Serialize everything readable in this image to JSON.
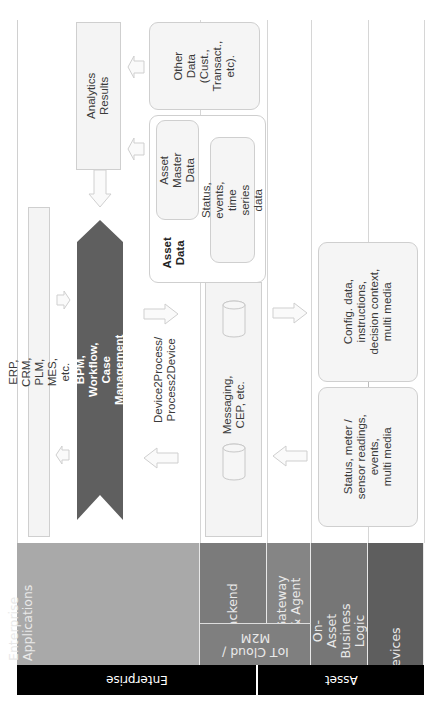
{
  "diagram": {
    "orientation": "rotated 90deg counter-clockwise (text reads bottom-to-top)",
    "layers": {
      "enterprise_applications": "Enterprise\nApplications",
      "iot_cloud_m2m": "IoT Cloud /\nM2M",
      "backend": "Backend",
      "gateway_agent": "Gateway\n& Agent",
      "on_asset_business_logic": "On-Asset\nBusiness Logic",
      "devices": "Devices"
    },
    "groups": {
      "enterprise": "Enterprise",
      "asset": "Asset"
    },
    "nodes": {
      "analytics_results": "Analytics\nResults",
      "other_data": "Other\nData\n(Cust.,\nTransact.,\netc).",
      "asset_data_title": "Asset\nData",
      "asset_master_data": "Asset\nMaster Data",
      "status_events_ts": "Status, events,\ntime series data",
      "erp_crm": "ERP, CRM, PLM, MES, etc.",
      "bpm_workflow": "BPM, Workflow, Case Management",
      "device2process": "Device2Process/\nProcess2Device",
      "messaging_cep": "Messaging,\nCEP, etc.",
      "config_data": "Config. data,\ninstructions,\ndecision context,\nmulti media",
      "status_meter": "Status, meter /\nsensor readings,\nevents,\nmulti media"
    },
    "colors": {
      "enterprise_apps_band": "#a9a9a9",
      "backend_band": "#7b7b7b",
      "gateway_band": "#858585",
      "iot_cloud_band": "#7f7f7f",
      "on_asset_band": "#767676",
      "devices_band": "#5e5e5e",
      "bpm_arrow": "#5f5f5f",
      "group_bar": "#000000",
      "box_fill": "#f4f4f4",
      "box_border": "#cfcfcf"
    }
  }
}
